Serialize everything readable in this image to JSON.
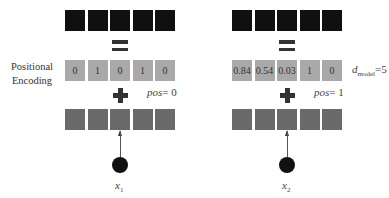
{
  "diagram": {
    "side_label_line1": "Positional",
    "side_label_line2": "Encoding",
    "d_model_symbol": "d",
    "d_model_subscript": "model",
    "d_model_value": "=5",
    "colors": {
      "embedding_cells": "#101010",
      "positional_cells": "#a9a9a9",
      "input_cells": "#6a6a6a",
      "operators": "#333333",
      "node": "#111111"
    },
    "tokens": [
      {
        "pos_label": "pos",
        "pos_value": "= 0",
        "x_symbol": "x",
        "x_subscript": "1",
        "encoding": [
          "0",
          "1",
          "0",
          "1",
          "0"
        ]
      },
      {
        "pos_label": "pos",
        "pos_value": "= 1",
        "x_symbol": "x",
        "x_subscript": "2",
        "encoding": [
          "0.84",
          "0.54",
          "0.03",
          "1",
          "0"
        ]
      }
    ]
  }
}
